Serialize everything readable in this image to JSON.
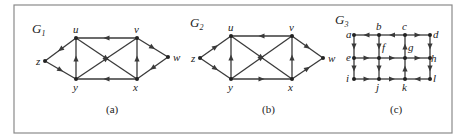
{
  "figure": {
    "graphs": [
      {
        "id": "G1",
        "title": "G",
        "subscript": "1",
        "caption": "(a)",
        "title_pos": [
          32,
          33
        ],
        "caption_pos": [
          106,
          113
        ],
        "nodes": {
          "z": [
            45,
            61
          ],
          "u": [
            76,
            38
          ],
          "v": [
            137,
            38
          ],
          "w": [
            168,
            57
          ],
          "x": [
            137,
            79
          ],
          "y": [
            76,
            79
          ]
        },
        "label_offsets": {
          "z": [
            -9,
            4
          ],
          "u": [
            -3,
            -5
          ],
          "v": [
            -3,
            -5
          ],
          "w": [
            5,
            4
          ],
          "x": [
            -4,
            12
          ],
          "y": [
            -3,
            12
          ]
        },
        "edges": [
          [
            "u",
            "z"
          ],
          [
            "z",
            "y"
          ],
          [
            "y",
            "u"
          ],
          [
            "v",
            "u"
          ],
          [
            "u",
            "x"
          ],
          [
            "y",
            "v"
          ],
          [
            "x",
            "y"
          ],
          [
            "x",
            "v"
          ],
          [
            "v",
            "w"
          ],
          [
            "w",
            "x"
          ]
        ]
      },
      {
        "id": "G2",
        "title": "G",
        "subscript": "2",
        "caption": "(b)",
        "title_pos": [
          190,
          27
        ],
        "caption_pos": [
          262,
          113
        ],
        "nodes": {
          "z": [
            200,
            58
          ],
          "u": [
            231,
            36
          ],
          "v": [
            292,
            36
          ],
          "w": [
            323,
            58
          ],
          "x": [
            292,
            79
          ],
          "y": [
            231,
            79
          ]
        },
        "label_offsets": {
          "z": [
            -9,
            4
          ],
          "u": [
            -3,
            -5
          ],
          "v": [
            -3,
            -5
          ],
          "w": [
            5,
            4
          ],
          "x": [
            -4,
            12
          ],
          "y": [
            -3,
            12
          ]
        },
        "edges": [
          [
            "z",
            "u"
          ],
          [
            "z",
            "y"
          ],
          [
            "y",
            "u"
          ],
          [
            "v",
            "u"
          ],
          [
            "u",
            "x"
          ],
          [
            "y",
            "v"
          ],
          [
            "y",
            "x"
          ],
          [
            "x",
            "v"
          ],
          [
            "v",
            "w"
          ],
          [
            "x",
            "w"
          ]
        ]
      },
      {
        "id": "G3",
        "title": "G",
        "subscript": "3",
        "caption": "(c)",
        "title_pos": [
          335,
          24
        ],
        "caption_pos": [
          390,
          113
        ],
        "nodes": {
          "a": [
            354,
            35
          ],
          "b": [
            379,
            35
          ],
          "c": [
            405,
            35
          ],
          "d": [
            430,
            35
          ],
          "e": [
            354,
            58
          ],
          "f": [
            379,
            58
          ],
          "g": [
            405,
            58
          ],
          "h": [
            430,
            58
          ],
          "i": [
            354,
            79
          ],
          "j": [
            379,
            79
          ],
          "k": [
            405,
            79
          ],
          "l": [
            430,
            79
          ]
        },
        "label_offsets": {
          "a": [
            -8,
            3
          ],
          "b": [
            -3,
            -5
          ],
          "c": [
            -3,
            -5
          ],
          "d": [
            3,
            3
          ],
          "e": [
            -8,
            3
          ],
          "f": [
            3,
            -7
          ],
          "g": [
            3,
            -7
          ],
          "h": [
            1,
            4
          ],
          "i": [
            -8,
            3
          ],
          "j": [
            -3,
            12
          ],
          "k": [
            -3,
            12
          ],
          "l": [
            3,
            3
          ]
        },
        "edges": [
          [
            "b",
            "a"
          ],
          [
            "c",
            "b"
          ],
          [
            "c",
            "d"
          ],
          [
            "a",
            "e"
          ],
          [
            "b",
            "f"
          ],
          [
            "e",
            "f"
          ],
          [
            "f",
            "j"
          ],
          [
            "e",
            "i"
          ],
          [
            "i",
            "j"
          ],
          [
            "f",
            "g"
          ],
          [
            "g",
            "h"
          ],
          [
            "g",
            "c"
          ],
          [
            "k",
            "g"
          ],
          [
            "j",
            "k"
          ],
          [
            "l",
            "k"
          ],
          [
            "d",
            "h"
          ],
          [
            "h",
            "l"
          ]
        ]
      }
    ]
  }
}
